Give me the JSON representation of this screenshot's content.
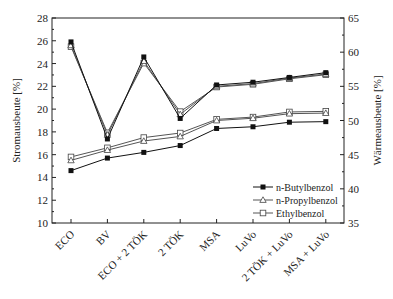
{
  "chart_data": {
    "type": "line",
    "title": "",
    "categories": [
      "ECO",
      "BV",
      "ECO + 2 TÖK",
      "2 TÖK",
      "MSA",
      "LuVo",
      "2 TÖK + LuVo",
      "MSA + LuVo"
    ],
    "ylabel": "Stromausbeute [%]",
    "ylabel_right": "Wärmeausbeute [%]",
    "ylim": [
      10,
      28
    ],
    "ylim_right": [
      35,
      65
    ],
    "yticks": [
      10,
      12,
      14,
      16,
      18,
      20,
      22,
      24,
      26,
      28
    ],
    "yticks_right": [
      35,
      40,
      45,
      50,
      55,
      60,
      65
    ],
    "legend": [
      "n-Butylbenzol",
      "n-Propylbenzol",
      "Ethylbenzol"
    ],
    "legend_position": "lower right",
    "grid": false,
    "series": [
      {
        "name": "n-Butylbenzol",
        "axis": "left",
        "metric": "Stromausbeute",
        "marker": "filled-square",
        "values": [
          14.6,
          15.7,
          16.2,
          16.8,
          18.3,
          18.45,
          18.85,
          18.9
        ]
      },
      {
        "name": "n-Propylbenzol",
        "axis": "left",
        "metric": "Stromausbeute",
        "marker": "open-triangle",
        "values": [
          15.5,
          16.4,
          17.2,
          17.6,
          19.0,
          19.2,
          19.6,
          19.65
        ]
      },
      {
        "name": "Ethylbenzol",
        "axis": "left",
        "metric": "Stromausbeute",
        "marker": "open-square",
        "values": [
          15.8,
          16.6,
          17.5,
          17.9,
          19.1,
          19.3,
          19.75,
          19.8
        ]
      },
      {
        "name": "n-Butylbenzol",
        "axis": "right",
        "metric": "Wärmeausbeute",
        "marker": "filled-square",
        "values": [
          61.5,
          47.3,
          59.3,
          50.3,
          55.2,
          55.6,
          56.3,
          57.0
        ]
      },
      {
        "name": "n-Propylbenzol",
        "axis": "right",
        "metric": "Wärmeausbeute",
        "marker": "open-triangle",
        "values": [
          61.0,
          47.9,
          58.7,
          50.9,
          55.0,
          55.4,
          56.2,
          56.8
        ]
      },
      {
        "name": "Ethylbenzol",
        "axis": "right",
        "metric": "Wärmeausbeute",
        "marker": "open-square",
        "values": [
          60.8,
          48.2,
          58.4,
          51.3,
          54.9,
          55.3,
          56.1,
          56.7
        ]
      }
    ]
  }
}
